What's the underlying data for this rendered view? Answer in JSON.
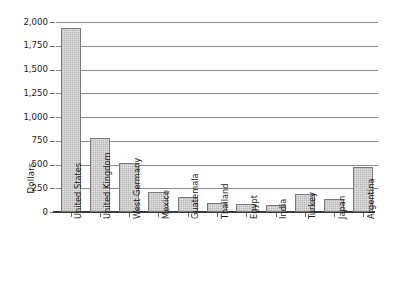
{
  "chart_data": {
    "type": "bar",
    "title": "",
    "xlabel": "",
    "ylabel": "Dollars",
    "ylim": [
      0,
      2000
    ],
    "ytick_step": 250,
    "grid": true,
    "legend": "none",
    "orientation": "vertical",
    "xtick_rotation": 90,
    "categories": [
      "United States",
      "United Kingdom",
      "West Germany",
      "Mexico",
      "Guatemala",
      "Thailand",
      "Egypt",
      "India",
      "Turkey",
      "Japan",
      "Argentina"
    ],
    "values": [
      1940,
      780,
      520,
      215,
      155,
      95,
      80,
      75,
      190,
      135,
      470
    ],
    "ytick_labels": [
      "2,000",
      "1,750",
      "1,500",
      "1,250",
      "1,000",
      "750",
      "500",
      "250",
      "0"
    ],
    "ytick_values": [
      2000,
      1750,
      1500,
      1250,
      1000,
      750,
      500,
      250,
      0
    ]
  },
  "style": {
    "bar_fill": "#e3e3e3",
    "bar_border": "#7a7a7a",
    "gridline_color": "#8c8c8c",
    "axis_color": "#3a3a3a",
    "text_color": "#1a1a1a",
    "background": "#ffffff"
  }
}
